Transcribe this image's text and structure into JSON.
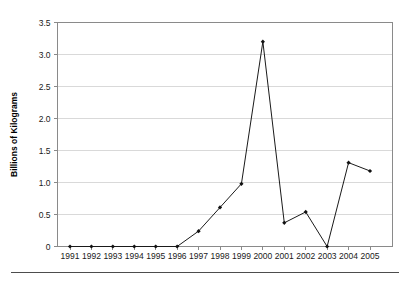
{
  "figure": {
    "width": 409,
    "height": 285,
    "background": "#ffffff",
    "line_color": "#1a1a1a",
    "marker_color": "#111111",
    "grid_color": "#d9d9d9",
    "axis_color": "#8a8a8a",
    "footer_rule_color": "#4d4d4d"
  },
  "chart_data": {
    "type": "line",
    "title": "",
    "subtitle": "",
    "xlabel": "",
    "ylabel": "Billions of Kilograms",
    "categories": [
      "1991",
      "1992",
      "1993",
      "1994",
      "1995",
      "1996",
      "1997",
      "1998",
      "1999",
      "2000",
      "2001",
      "2002",
      "2003",
      "2004",
      "2005"
    ],
    "values": [
      0,
      0,
      0,
      0,
      0,
      0,
      0.24,
      0.61,
      0.98,
      3.2,
      0.37,
      0.54,
      0,
      1.31,
      1.18
    ],
    "series": [
      {
        "name": "",
        "values": [
          0,
          0,
          0,
          0,
          0,
          0,
          0.24,
          0.61,
          0.98,
          3.2,
          0.37,
          0.54,
          0,
          1.31,
          1.18
        ]
      }
    ],
    "ylim": [
      0,
      3.5
    ],
    "yticks": [
      0,
      0.5,
      1.0,
      1.5,
      2.0,
      2.5,
      3.0,
      3.5
    ],
    "ytick_labels": [
      "0",
      "0.5",
      "1.0",
      "1.5",
      "2.0",
      "2.5",
      "3.0",
      "3.5"
    ],
    "xtick_labels": [
      "1991",
      "1992",
      "1993",
      "1994",
      "1995",
      "1996",
      "1997",
      "1998",
      "1999",
      "2000",
      "2001",
      "2002",
      "2003",
      "2004",
      "2005"
    ],
    "grid": "horizontal",
    "legend": "none",
    "markers": "filled-diamond",
    "annotations": []
  }
}
